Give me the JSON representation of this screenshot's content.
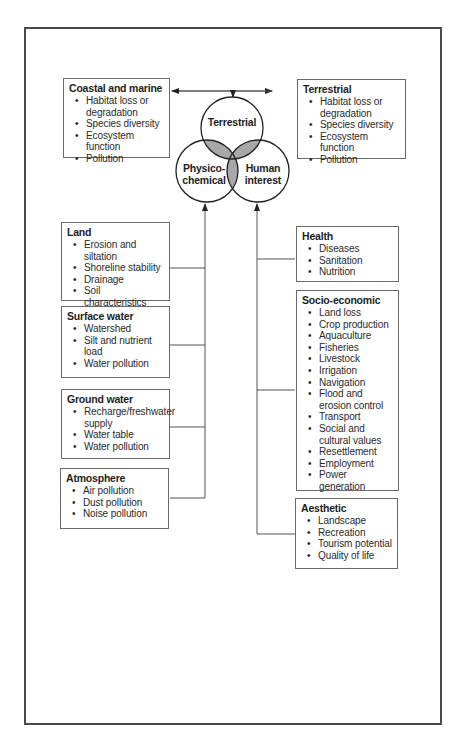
{
  "circles": {
    "top": "Terrestrial",
    "left_line1": "Physico-",
    "left_line2": "chemical",
    "right_line1": "Human",
    "right_line2": "interest"
  },
  "boxes": {
    "coastal": {
      "title": "Coastal and marine",
      "items": [
        "Habitat loss or degradation",
        "Species diversity",
        "Ecosystem function",
        "Pollution"
      ]
    },
    "terrestrial": {
      "title": "Terrestrial",
      "items": [
        "Habitat loss or degradation",
        "Species diversity",
        "Ecosystem function",
        "Pollution"
      ]
    },
    "land": {
      "title": "Land",
      "items": [
        "Erosion and siltation",
        "Shoreline stability",
        "Drainage",
        "Soil characteristics"
      ]
    },
    "surface_water": {
      "title": "Surface water",
      "items": [
        "Watershed",
        "Silt and nutrient load",
        "Water pollution"
      ]
    },
    "ground_water": {
      "title": "Ground water",
      "items": [
        "Recharge/freshwater supply",
        "Water table",
        "Water pollution"
      ]
    },
    "atmosphere": {
      "title": "Atmosphere",
      "items": [
        "Air pollution",
        "Dust pollution",
        "Noise pollution"
      ]
    },
    "health": {
      "title": "Health",
      "items": [
        "Diseases",
        "Sanitation",
        "Nutrition"
      ]
    },
    "socio_economic": {
      "title": "Socio-economic",
      "items": [
        "Land loss",
        "Crop production",
        "Aquaculture",
        "Fisheries",
        "Livestock",
        "Irrigation",
        "Navigation",
        "Flood and erosion control",
        "Transport",
        "Social and cultural values",
        "Resettlement",
        "Employment",
        "Power generation"
      ]
    },
    "aesthetic": {
      "title": "Aesthetic",
      "items": [
        "Landscape",
        "Recreation",
        "Tourism potential",
        "Quality of life"
      ]
    }
  },
  "colors": {
    "line": "#555555",
    "overlap_fill": "#a8a8a8",
    "border": "#4a4a4a"
  }
}
